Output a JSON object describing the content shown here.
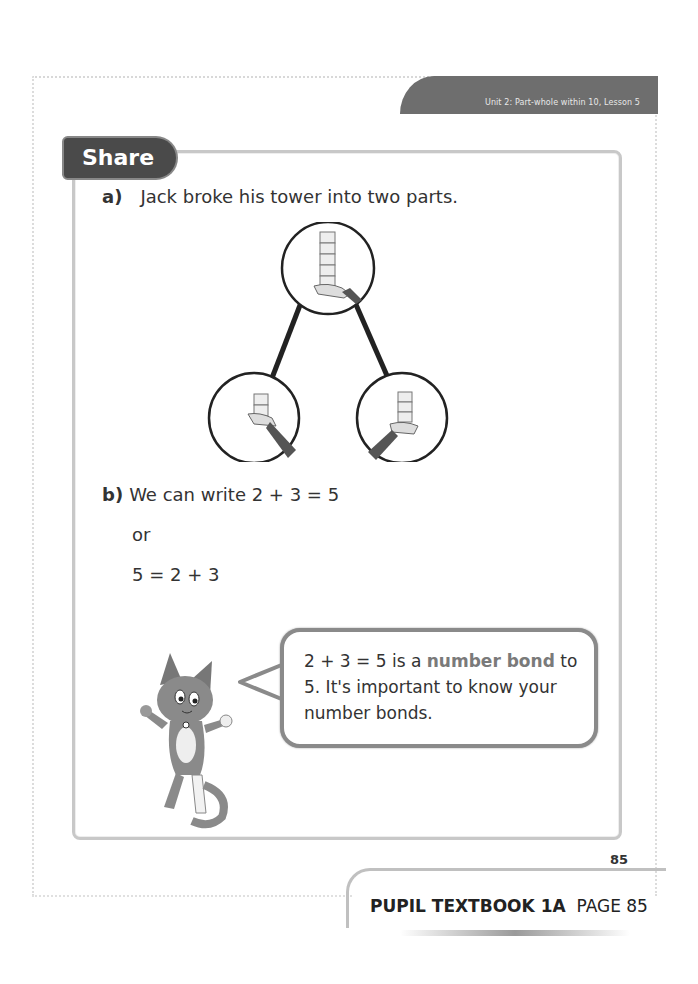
{
  "header": {
    "unit_label": "Unit 2: Part-whole within 10, Lesson 5"
  },
  "section": {
    "title": "Share"
  },
  "question_a": {
    "letter": "a)",
    "text": "Jack broke his tower into two parts."
  },
  "diagram": {
    "whole": {
      "cubes": 5,
      "label": "tower of 5 cubes held in hand"
    },
    "part_left": {
      "cubes": 2,
      "label": "tower of 2 cubes held in hand"
    },
    "part_right": {
      "cubes": 3,
      "label": "tower of 3 cubes held in hand"
    }
  },
  "question_b": {
    "letter": "b)",
    "text": "We can write 2 + 3 = 5",
    "or": "or",
    "equation2": "5 = 2 + 3"
  },
  "speech_bubble": {
    "part1": "2 + 3 = 5 is a ",
    "highlight": "number bond",
    "part2": " to 5. It's important to know your number bonds."
  },
  "footer": {
    "page_number": "85",
    "book_label": "PUPIL TEXTBOOK 1A",
    "page_label": "PAGE 85"
  }
}
